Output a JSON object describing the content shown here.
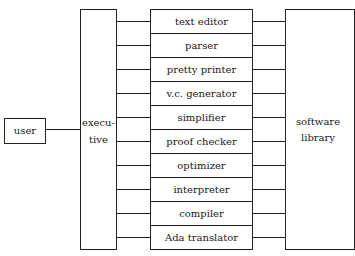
{
  "diagram": {
    "user": {
      "label": "user"
    },
    "executive": {
      "line1": "execu-",
      "line2": "tive"
    },
    "modules": [
      {
        "label": "text editor"
      },
      {
        "label": "parser"
      },
      {
        "label": "pretty printer"
      },
      {
        "label": "v.c. generator"
      },
      {
        "label": "simplifier"
      },
      {
        "label": "proof checker"
      },
      {
        "label": "optimizer"
      },
      {
        "label": "interpreter"
      },
      {
        "label": "compiler"
      },
      {
        "label": "Ada translator"
      }
    ],
    "library": {
      "line1": "software",
      "line2": "library"
    },
    "connections": [
      {
        "from": "user",
        "to": "executive"
      },
      {
        "from": "executive",
        "to": "modules"
      },
      {
        "from": "modules",
        "to": "software library"
      }
    ]
  }
}
